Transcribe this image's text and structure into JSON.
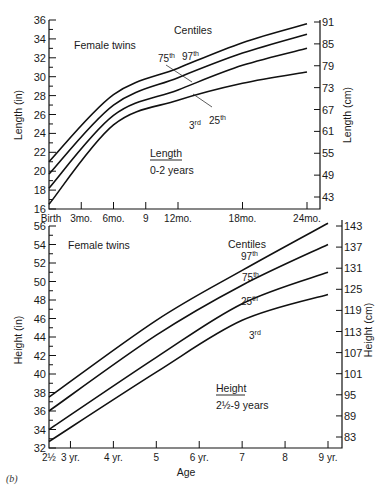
{
  "figure_label": "(b)",
  "chart_data": [
    {
      "type": "line",
      "title": "Length 0-2 years",
      "subtitle": "Female twins",
      "legend_title": "Centiles",
      "xlabel": "",
      "ylabel": "Length (in)",
      "ylabel_right": "Length (cm)",
      "x_ticks": [
        "Birth",
        "3mo.",
        "6mo.",
        "9",
        "12mo.",
        "18mo.",
        "24mo."
      ],
      "x_tick_months": [
        0,
        3,
        6,
        9,
        12,
        18,
        24
      ],
      "x": [
        0,
        6,
        12,
        18,
        24
      ],
      "ylim": [
        16,
        36
      ],
      "y_ticks": [
        16,
        18,
        20,
        22,
        24,
        26,
        28,
        30,
        32,
        34,
        36
      ],
      "y_ticks_right": [
        43,
        49,
        55,
        61,
        67,
        73,
        79,
        85,
        91
      ],
      "grid": false,
      "series": [
        {
          "name": "97th",
          "values": [
            21.0,
            28.1,
            30.9,
            33.6,
            35.6
          ]
        },
        {
          "name": "75th",
          "values": [
            19.7,
            27.0,
            29.9,
            32.5,
            34.5
          ]
        },
        {
          "name": "25th",
          "values": [
            18.2,
            25.9,
            28.6,
            31.2,
            33.0
          ]
        },
        {
          "name": "3rd",
          "values": [
            16.5,
            24.9,
            27.5,
            29.3,
            30.5
          ]
        }
      ]
    },
    {
      "type": "line",
      "title": "Height 2½-9 years",
      "subtitle": "Female twins",
      "legend_title": "Centiles",
      "xlabel": "Age",
      "ylabel": "Height (in)",
      "ylabel_right": "Height (cm)",
      "x_ticks": [
        "2½",
        "3 yr.",
        "4 yr.",
        "5",
        "6 yr.",
        "7",
        "8",
        "9 yr."
      ],
      "x_tick_years": [
        2.5,
        3,
        4,
        5,
        6,
        7,
        8,
        9
      ],
      "x": [
        2.5,
        5,
        7,
        9
      ],
      "ylim": [
        32,
        56
      ],
      "y_ticks": [
        32,
        34,
        36,
        38,
        40,
        42,
        44,
        46,
        48,
        50,
        52,
        54,
        56
      ],
      "y_ticks_right": [
        83,
        89,
        95,
        101,
        107,
        113,
        119,
        125,
        131,
        137,
        143
      ],
      "grid": false,
      "series": [
        {
          "name": "97th",
          "values": [
            37.5,
            45.8,
            51.2,
            56.3
          ]
        },
        {
          "name": "75th",
          "values": [
            36.0,
            44.2,
            49.6,
            54.0
          ]
        },
        {
          "name": "25th",
          "values": [
            34.0,
            41.8,
            47.6,
            51.0
          ]
        },
        {
          "name": "3rd",
          "values": [
            32.7,
            40.2,
            45.8,
            48.6
          ]
        }
      ]
    }
  ],
  "top": {
    "subtitle": "Female twins",
    "legend_title": "Centiles",
    "label_75": "75",
    "label_97": "97",
    "label_25": "25",
    "label_3": "3",
    "sup_th": "th",
    "sup_rd": "rd",
    "note_title": "Length",
    "note_range": "0-2 years",
    "ylabel": "Length (in)",
    "ylabel_right": "Length (cm)"
  },
  "bottom": {
    "subtitle": "Female twins",
    "legend_title": "Centiles",
    "label_97": "97",
    "label_75": "75",
    "label_25": "25",
    "label_3": "3",
    "sup_th": "th",
    "sup_rd": "rd",
    "note_title": "Height",
    "note_range": "2½-9 years",
    "ylabel": "Height (in)",
    "ylabel_right": "Height (cm)",
    "xlabel": "Age"
  }
}
